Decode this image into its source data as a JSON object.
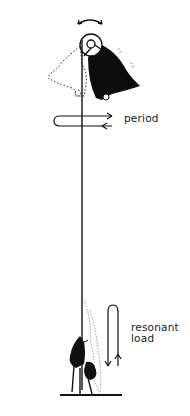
{
  "diagram": {
    "labels": {
      "period": "period",
      "resonant_load_line1": "resonant",
      "resonant_load_line2": "load"
    },
    "elements": [
      {
        "id": "swing-arrow",
        "description": "curved double-headed arrow above pulley indicating swing"
      },
      {
        "id": "bell-solid",
        "description": "black bell swung to the right"
      },
      {
        "id": "bell-dotted",
        "description": "dotted outline of bell swung to the left"
      },
      {
        "id": "wheel",
        "description": "pulley wheel at top of bell"
      },
      {
        "id": "rope",
        "description": "vertical bell rope"
      },
      {
        "id": "period-arrow",
        "description": "horizontal loop arrow crossing rope"
      },
      {
        "id": "ringer",
        "description": "person pulling rope, with dotted alternate position"
      },
      {
        "id": "load-arrow",
        "description": "vertical loop arrow next to ringer"
      },
      {
        "id": "floor",
        "description": "floor line under ringer"
      }
    ],
    "colors": {
      "ink": "#111111",
      "background": "#ffffff",
      "faint": "#9a9a9a"
    }
  }
}
